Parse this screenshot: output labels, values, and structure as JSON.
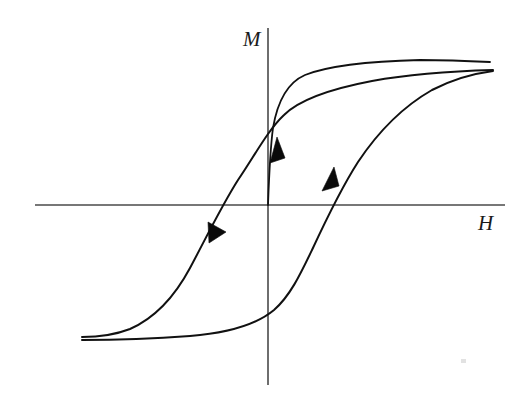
{
  "figure": {
    "background_color": "#ffffff",
    "width": 527,
    "height": 407
  },
  "axes": {
    "vertical": {
      "label": "M",
      "name": "magnetization-axis",
      "x": 268,
      "y_top": 28,
      "y_bottom": 385,
      "color": "#4a4a4a"
    },
    "horizontal": {
      "label": "H",
      "name": "field-axis",
      "y": 205,
      "x_left": 35,
      "x_right": 505,
      "color": "#4a4a4a"
    },
    "label_positions": {
      "M": {
        "x": 243,
        "y": 46
      },
      "H": {
        "x": 478,
        "y": 230
      }
    }
  },
  "chart_data": {
    "type": "line",
    "xlabel": "H",
    "ylabel": "M",
    "grid": false,
    "legend": null,
    "axis_origin": {
      "x": 268,
      "y": 205
    },
    "xlim": [
      35,
      505
    ],
    "ylim": [
      385,
      28
    ],
    "curve_color": "#111111",
    "series": [
      {
        "name": "initial-magnetization-curve",
        "label": "Initial (virgin) magnetization curve",
        "direction": "increasing-field",
        "path": "M 268 205 C 269 178 270 150 273 128 C 278 98 289 82 305 75 C 330 65 380 61 420 60 C 446 60 470 61 490 62"
      },
      {
        "name": "descending-branch",
        "label": "Upper branch: field decreasing from positive saturation",
        "direction": "decreasing-field",
        "path": "M 493 70 C 455 71 410 74 372 81 C 330 89 300 99 284 115 C 268 130 255 155 238 180 C 222 205 205 240 190 268 C 175 296 155 318 130 329 C 112 336 95 337 82 337"
      },
      {
        "name": "ascending-branch",
        "label": "Lower branch: field increasing from negative saturation",
        "direction": "increasing-field",
        "path": "M 82 340 C 110 340 150 339 190 336 C 228 333 256 325 274 310 C 290 296 300 275 312 250 C 325 222 340 190 358 162 C 378 132 404 106 432 90 C 455 78 478 73 493 71"
      }
    ],
    "arrows": [
      {
        "name": "arrow-descending-branch",
        "on_series": "descending-branch",
        "direction": "down-left",
        "tip": {
          "x": 209,
          "y": 243
        },
        "polygon": "209,243 208,222 226,232"
      },
      {
        "name": "arrow-initial-curve",
        "on_series": "initial-magnetization-curve",
        "direction": "up",
        "tip": {
          "x": 277,
          "y": 137
        },
        "polygon": "277,137 270,163 285,158"
      },
      {
        "name": "arrow-ascending-branch",
        "on_series": "ascending-branch",
        "direction": "up-right",
        "tip": {
          "x": 334,
          "y": 167
        },
        "polygon": "334,167 322,191 339,186"
      }
    ],
    "features": {
      "saturation_positive": {
        "x": 460,
        "y": 72
      },
      "saturation_negative": {
        "x": 95,
        "y": 338
      },
      "remanence_positive_M": {
        "x": 268,
        "y": 120
      },
      "remanence_negative_M": {
        "x": 268,
        "y": 301
      },
      "coercivity_negative_H": {
        "x": 213,
        "y": 205
      },
      "coercivity_positive_H": {
        "x": 324,
        "y": 205
      }
    }
  },
  "artifacts": [
    {
      "name": "scan-speck",
      "x": 461,
      "y": 359,
      "width": 5,
      "height": 4
    }
  ]
}
